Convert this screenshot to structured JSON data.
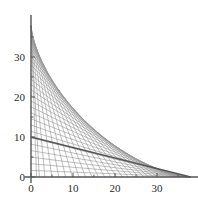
{
  "chart_data": {
    "type": "line",
    "title": "",
    "subtitle": "",
    "xlabel": "",
    "ylabel": "",
    "xlim": [
      -1.5,
      40.5
    ],
    "ylim": [
      -1.5,
      40.5
    ],
    "grid": false,
    "legend": null,
    "axis_color": "#555555",
    "line_color": "#8e8e8e",
    "highlight_color": "#555555",
    "envelope_color": "#999999",
    "x_ticks_major": [
      0,
      10,
      20,
      30
    ],
    "x_tick_labels": [
      "0",
      "10",
      "20",
      "30"
    ],
    "x_ticks_minor": [
      5,
      15,
      25,
      35
    ],
    "y_ticks_major": [
      0,
      10,
      20,
      30
    ],
    "y_tick_labels": [
      "0",
      "10",
      "20",
      "30"
    ],
    "y_ticks_minor": [
      5,
      15,
      25,
      35
    ],
    "envelope": {
      "name": "astroid envelope",
      "equation": "x^(2/3) + y^(2/3) = 38^(2/3)",
      "L": 38,
      "points": [
        [
          0.0,
          38.0
        ],
        [
          0.02,
          34.6
        ],
        [
          0.15,
          31.4
        ],
        [
          0.49,
          28.3
        ],
        [
          1.14,
          25.3
        ],
        [
          2.19,
          22.4
        ],
        [
          3.71,
          19.7
        ],
        [
          5.76,
          17.0
        ],
        [
          8.36,
          14.5
        ],
        [
          11.5,
          12.0
        ],
        [
          14.5,
          9.6
        ],
        [
          17.0,
          7.4
        ],
        [
          19.7,
          5.4
        ],
        [
          22.4,
          3.7
        ],
        [
          25.3,
          2.3
        ],
        [
          28.3,
          1.2
        ],
        [
          31.4,
          0.5
        ],
        [
          34.6,
          0.1
        ],
        [
          38.0,
          0.0
        ]
      ]
    },
    "series": [
      {
        "name": "rod-family",
        "type": "segments",
        "count": 36,
        "rod_length": 38,
        "note": "Each segment runs from (L*cos(t), 0) to (0, L*sin(t)) for t sampled between 2.5 and 88 degrees",
        "angles_deg": [
          2.5,
          5,
          7.5,
          10,
          12.5,
          15,
          17.5,
          20,
          22.5,
          25,
          27.5,
          30,
          32.5,
          35,
          37.5,
          40,
          42.5,
          45,
          47.5,
          50,
          52.5,
          55,
          57.5,
          60,
          62.5,
          65,
          67.5,
          70,
          72.5,
          75,
          77.5,
          80,
          82.5,
          85,
          87,
          88
        ]
      },
      {
        "name": "highlighted-rod",
        "type": "segment",
        "x": [
          0,
          38
        ],
        "y": [
          10,
          0
        ],
        "note": "single darker emphasized line from (0,10) to (38,0)"
      }
    ]
  },
  "plot": {
    "background_color": "#ffffff",
    "axis_line_width": 1.4,
    "family_line_width": 0.6,
    "highlight_line_width": 1.4
  }
}
